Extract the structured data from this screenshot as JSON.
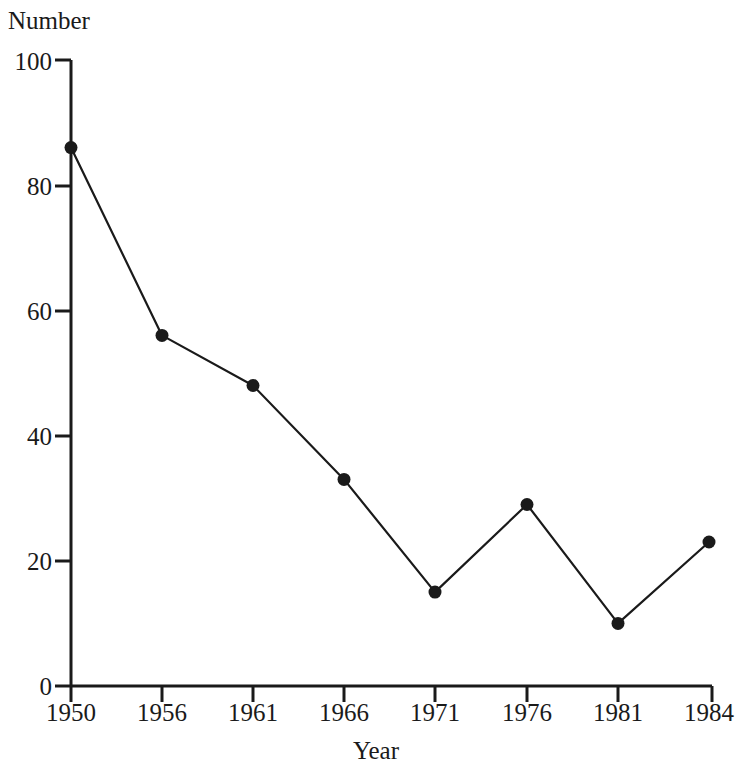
{
  "chart_data": {
    "type": "line",
    "title": "",
    "xlabel": "Year",
    "ylabel": "Number",
    "categories": [
      "1950",
      "1956",
      "1961",
      "1966",
      "1971",
      "1976",
      "1981",
      "1984"
    ],
    "values": [
      86,
      56,
      48,
      33,
      15,
      29,
      10,
      23
    ],
    "series": [
      {
        "name": "Number",
        "values": [
          86,
          56,
          48,
          33,
          15,
          29,
          10,
          23
        ]
      }
    ],
    "ylim": [
      0,
      100
    ],
    "yticks": [
      "0",
      "20",
      "40",
      "60",
      "80",
      "100"
    ],
    "ytick_values": [
      0,
      20,
      40,
      60,
      80,
      100
    ],
    "xticks": [
      "1950",
      "1956",
      "1961",
      "1966",
      "1971",
      "1976",
      "1981",
      "1984"
    ],
    "grid": false,
    "legend": "none",
    "marker": "filled-circle",
    "line_color": "#1a1a1a",
    "marker_color": "#1a1a1a",
    "background_color": "#ffffff",
    "annotations": []
  }
}
